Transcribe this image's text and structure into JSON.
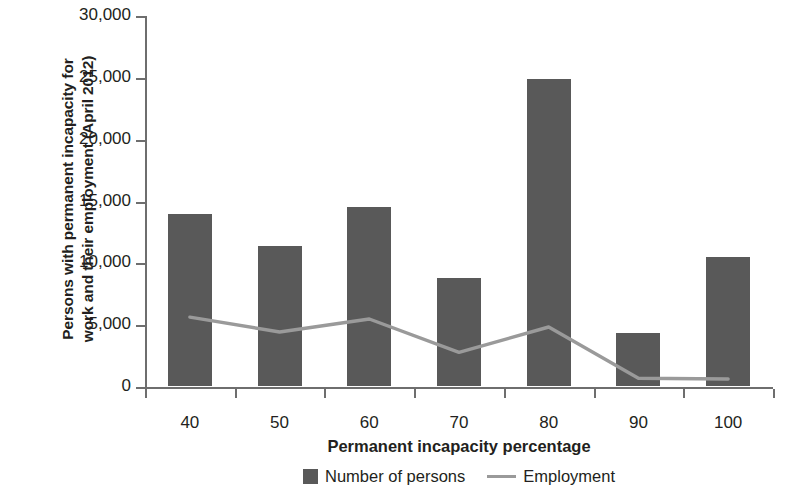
{
  "chart_data": {
    "type": "bar",
    "title": "",
    "xlabel": "Permanent incapacity percentage",
    "ylabel": "Persons with permanent incapacity for work and their employment (April 2012)",
    "ylabel_line1": "Persons with permanent incapacity for",
    "ylabel_line2": "work and their employment (April 2012)",
    "categories": [
      "40",
      "50",
      "60",
      "70",
      "80",
      "90",
      "100"
    ],
    "ylim": [
      0,
      30000
    ],
    "yticks": [
      0,
      5000,
      10000,
      15000,
      20000,
      25000,
      30000
    ],
    "ytick_labels": [
      "0",
      "5,000",
      "10,000",
      "15,000",
      "20,000",
      "25,000",
      "30,000"
    ],
    "grid": false,
    "legend_position": "bottom",
    "series": [
      {
        "name": "Number of persons",
        "type": "bar",
        "color": "#595959",
        "values": [
          13950,
          11300,
          14500,
          8700,
          24850,
          4300,
          10450
        ]
      },
      {
        "name": "Employment",
        "type": "line",
        "color": "#9a9a9a",
        "values": [
          5650,
          4450,
          5500,
          2800,
          4850,
          700,
          650
        ]
      }
    ]
  },
  "legend": {
    "items": [
      {
        "label": "Number of persons",
        "marker": "square-swatch-icon"
      },
      {
        "label": "Employment",
        "marker": "line-swatch-icon"
      }
    ]
  }
}
